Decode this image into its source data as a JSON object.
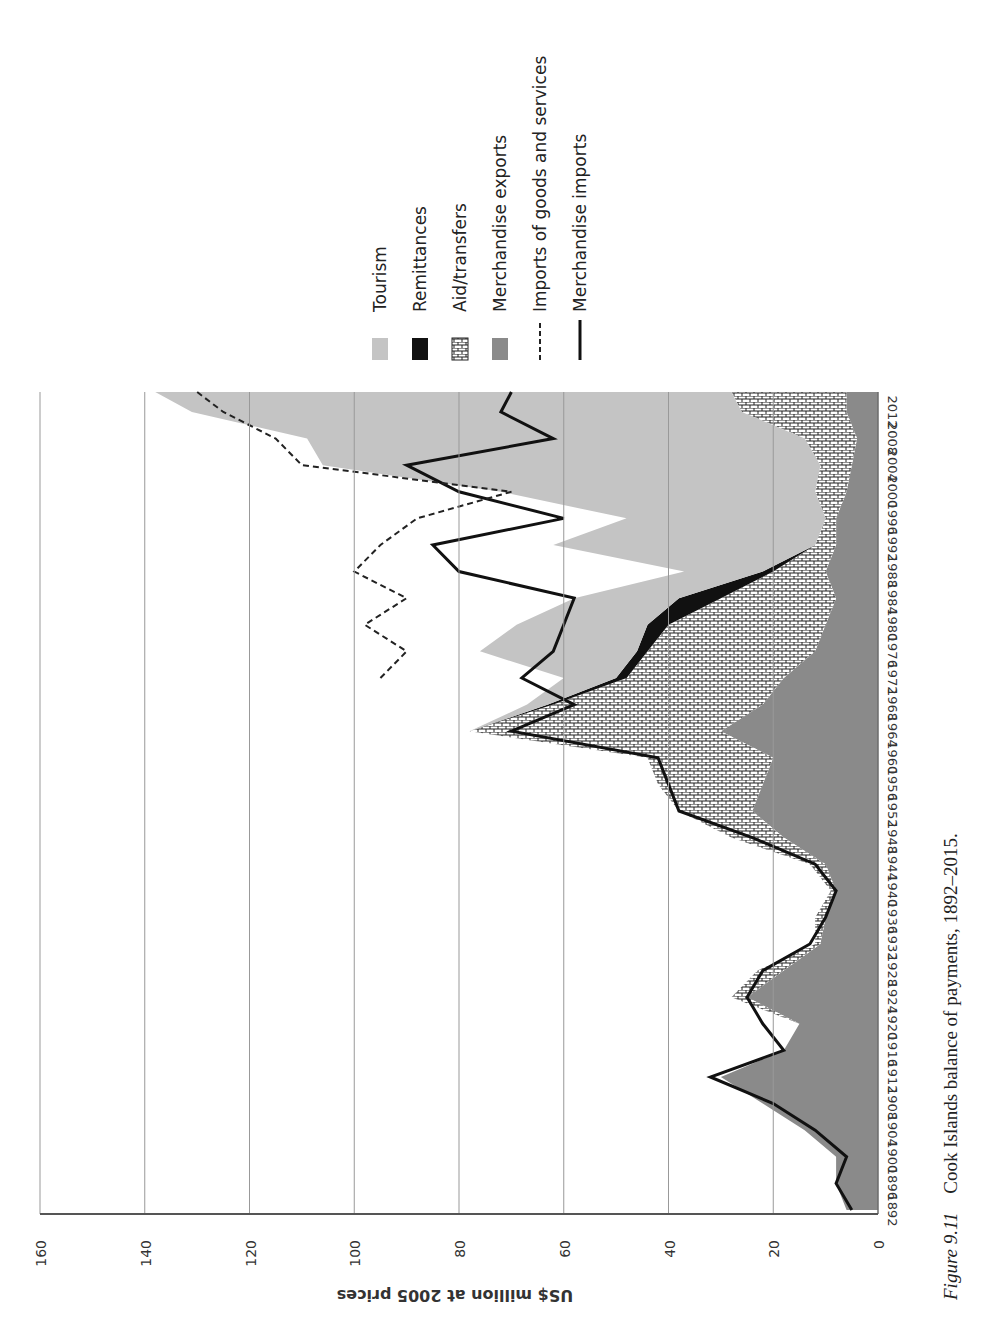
{
  "figure": {
    "number": "Figure 9.11",
    "title": "Cook Islands balance of payments, 1892–2015."
  },
  "axis": {
    "ylabel": "US$ million at 2005 prices",
    "yticks": [
      "0",
      "20",
      "40",
      "60",
      "80",
      "100",
      "120",
      "140",
      "160"
    ],
    "xticks": [
      "1892",
      "1896",
      "1900",
      "1904",
      "1908",
      "1912",
      "1916",
      "1920",
      "1924",
      "1928",
      "1932",
      "1936",
      "1940",
      "1944",
      "1948",
      "1952",
      "1956",
      "1960",
      "1964",
      "1968",
      "1972",
      "1976",
      "1980",
      "1984",
      "1988",
      "1992",
      "1996",
      "2000",
      "2004",
      "2008",
      "2012"
    ]
  },
  "legend": [
    {
      "label": "Tourism",
      "swatch": "fill",
      "color": "#c4c4c4"
    },
    {
      "label": "Remittances",
      "swatch": "fill",
      "color": "#111111"
    },
    {
      "label": "Aid/transfers",
      "swatch": "brick",
      "color": "#ffffff"
    },
    {
      "label": "Merchandise exports",
      "swatch": "fill",
      "color": "#8a8a8a"
    },
    {
      "label": "Imports of goods and services",
      "swatch": "dashed",
      "color": "#222222"
    },
    {
      "label": "Merchandise imports",
      "swatch": "solid",
      "color": "#111111"
    }
  ],
  "chart_data": {
    "type": "area",
    "note": "Approximate values estimated visually; chart is rotated 90° CCW in source. Only limited close-up inspection was possible, so values are rough (about ±3-5).",
    "title": "Cook Islands balance of payments, 1892–2015",
    "xlabel": "",
    "ylabel": "US$ million at 2005 prices",
    "ylim": [
      0,
      160
    ],
    "xlim": [
      1892,
      2015
    ],
    "x": [
      1892,
      1896,
      1900,
      1904,
      1908,
      1912,
      1916,
      1920,
      1924,
      1928,
      1932,
      1936,
      1940,
      1944,
      1948,
      1952,
      1956,
      1960,
      1964,
      1968,
      1972,
      1976,
      1980,
      1984,
      1988,
      1992,
      1996,
      2000,
      2004,
      2008,
      2012,
      2015
    ],
    "stacked_areas": [
      {
        "name": "Merchandise exports",
        "values": [
          6,
          8,
          8,
          14,
          22,
          30,
          18,
          15,
          25,
          18,
          11,
          10,
          8,
          10,
          18,
          24,
          22,
          20,
          30,
          22,
          18,
          12,
          10,
          8,
          10,
          8,
          8,
          6,
          5,
          4,
          6,
          6
        ]
      },
      {
        "name": "Aid/transfers",
        "values": [
          0,
          0,
          0,
          0,
          0,
          0,
          0,
          0,
          3,
          5,
          1,
          2,
          1,
          3,
          10,
          14,
          20,
          24,
          48,
          40,
          30,
          32,
          30,
          22,
          10,
          4,
          2,
          6,
          6,
          10,
          20,
          22
        ]
      },
      {
        "name": "Remittances",
        "values": [
          0,
          0,
          0,
          0,
          0,
          0,
          0,
          0,
          0,
          0,
          0,
          0,
          0,
          0,
          0,
          0,
          0,
          0,
          0,
          1,
          2,
          2,
          4,
          8,
          2,
          0,
          0,
          0,
          0,
          0,
          0,
          0
        ]
      },
      {
        "name": "Tourism",
        "values": [
          0,
          0,
          0,
          0,
          0,
          0,
          0,
          0,
          0,
          0,
          0,
          0,
          0,
          0,
          0,
          0,
          0,
          0,
          0,
          4,
          10,
          30,
          25,
          20,
          15,
          50,
          38,
          60,
          95,
          95,
          105,
          110
        ]
      }
    ],
    "lines": [
      {
        "name": "Imports of goods and services",
        "style": "dashed",
        "start_year": 1970,
        "values_from_1972": [
          95,
          90,
          98,
          90,
          100,
          95,
          88,
          70,
          110,
          115,
          125,
          130,
          135
        ]
      },
      {
        "name": "Merchandise imports",
        "style": "solid",
        "values": [
          5,
          8,
          6,
          12,
          20,
          32,
          18,
          22,
          25,
          22,
          13,
          10,
          8,
          12,
          24,
          38,
          40,
          42,
          70,
          58,
          68,
          62,
          60,
          58,
          80,
          85,
          60,
          80,
          90,
          62,
          72,
          70
        ]
      }
    ]
  }
}
